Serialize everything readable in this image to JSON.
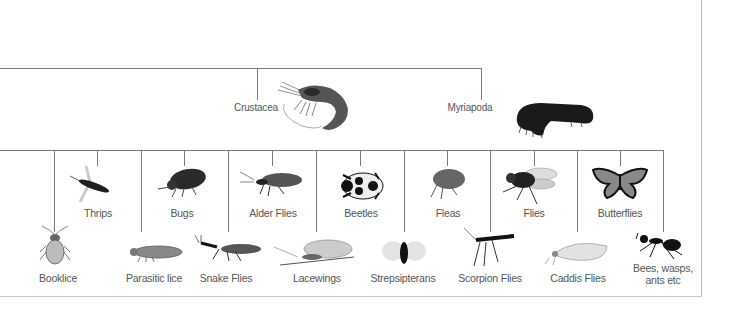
{
  "diagram": {
    "type": "tree",
    "upper_branch": {
      "nodes": [
        {
          "label": "Crustacea",
          "icon": "shrimp-icon"
        },
        {
          "label": "Myriapoda",
          "icon": "millipede-icon"
        }
      ]
    },
    "insect_orders": [
      {
        "label": "Booklice",
        "icon": "booklouse-icon",
        "row": "lower"
      },
      {
        "label": "Thrips",
        "icon": "thrips-icon",
        "row": "upper"
      },
      {
        "label": "Parasitic lice",
        "icon": "louse-icon",
        "row": "lower"
      },
      {
        "label": "Bugs",
        "icon": "bug-icon",
        "row": "upper"
      },
      {
        "label": "Snake Flies",
        "icon": "snakefly-icon",
        "row": "lower"
      },
      {
        "label": "Alder Flies",
        "icon": "alderfly-icon",
        "row": "upper"
      },
      {
        "label": "Lacewings",
        "icon": "lacewing-icon",
        "row": "lower"
      },
      {
        "label": "Beetles",
        "icon": "beetle-icon",
        "row": "upper"
      },
      {
        "label": "Strepsipterans",
        "icon": "strepsipteran-icon",
        "row": "lower"
      },
      {
        "label": "Fleas",
        "icon": "flea-icon",
        "row": "upper"
      },
      {
        "label": "Scorpion Flies",
        "icon": "scorpionfly-icon",
        "row": "lower"
      },
      {
        "label": "Flies",
        "icon": "fly-icon",
        "row": "upper"
      },
      {
        "label": "Caddis Flies",
        "icon": "caddisfly-icon",
        "row": "lower"
      },
      {
        "label": "Butterflies",
        "icon": "butterfly-icon",
        "row": "upper"
      },
      {
        "label": "Bees, wasps,",
        "label_line2": "ants etc",
        "icon": "ant-icon",
        "row": "lower"
      }
    ],
    "line_color": "#7a7a7a",
    "text_color": "#555555"
  }
}
